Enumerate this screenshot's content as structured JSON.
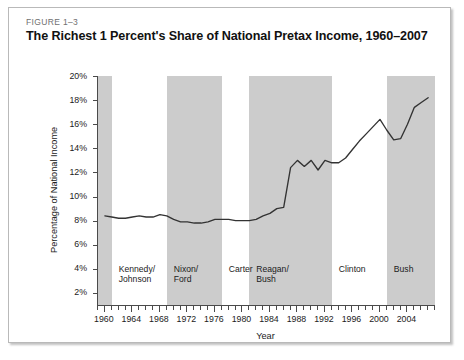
{
  "figure": {
    "number": "FIGURE 1–3",
    "title": "The Richest 1 Percent's Share of National Pretax Income, 1960–2007"
  },
  "chart_data": {
    "type": "line",
    "title": "The Richest 1 Percent's Share of National Pretax Income, 1960–2007",
    "xlabel": "Year",
    "ylabel": "Percentage of National Income",
    "xlim": [
      1959,
      2008
    ],
    "ylim": [
      1,
      20
    ],
    "grid": false,
    "legend": "none",
    "line_color": "#333333",
    "band_color": "#cccccc",
    "y_ticks": [
      "2%",
      "4%",
      "6%",
      "8%",
      "10%",
      "12%",
      "14%",
      "16%",
      "18%",
      "20%"
    ],
    "y_tick_values": [
      2,
      4,
      6,
      8,
      10,
      12,
      14,
      16,
      18,
      20
    ],
    "x_ticks": [
      "1960",
      "1964",
      "1968",
      "1972",
      "1976",
      "1980",
      "1984",
      "1988",
      "1992",
      "1996",
      "2000",
      "2004"
    ],
    "x_tick_values": [
      1960,
      1964,
      1968,
      1972,
      1976,
      1980,
      1984,
      1988,
      1992,
      1996,
      2000,
      2004
    ],
    "x_minor_tick_step": 1,
    "x": [
      1960,
      1961,
      1962,
      1963,
      1964,
      1965,
      1966,
      1967,
      1968,
      1969,
      1970,
      1971,
      1972,
      1973,
      1974,
      1975,
      1976,
      1977,
      1978,
      1979,
      1980,
      1981,
      1982,
      1983,
      1984,
      1985,
      1986,
      1987,
      1988,
      1989,
      1990,
      1991,
      1992,
      1993,
      1994,
      1995,
      1996,
      1997,
      1998,
      1999,
      2000,
      2001,
      2002,
      2003,
      2004,
      2005,
      2006,
      2007
    ],
    "values": [
      8.4,
      8.3,
      8.2,
      8.2,
      8.3,
      8.4,
      8.3,
      8.3,
      8.5,
      8.4,
      8.1,
      7.9,
      7.9,
      7.8,
      7.8,
      7.9,
      8.1,
      8.1,
      8.1,
      8.0,
      8.0,
      8.0,
      8.1,
      8.4,
      8.6,
      9.0,
      9.1,
      12.4,
      13.0,
      12.5,
      13.0,
      12.2,
      13.0,
      12.8,
      12.8,
      13.2,
      13.9,
      14.6,
      15.2,
      15.8,
      16.4,
      15.5,
      14.7,
      14.8,
      16.0,
      17.4,
      17.8,
      18.2
    ],
    "annotations": [
      {
        "label": "Kennedy/\nJohnson",
        "start": 1961,
        "end": 1969,
        "shaded": false
      },
      {
        "label": "Nixon/\nFord",
        "start": 1969,
        "end": 1977,
        "shaded": true
      },
      {
        "label": "Carter",
        "start": 1977,
        "end": 1981,
        "shaded": false
      },
      {
        "label": "Reagan/\nBush",
        "start": 1981,
        "end": 1993,
        "shaded": true
      },
      {
        "label": "Clinton",
        "start": 1993,
        "end": 2001,
        "shaded": false
      },
      {
        "label": "Bush",
        "start": 2001,
        "end": 2008,
        "shaded": true
      }
    ]
  },
  "eras": [
    {
      "name": "pre-kennedy",
      "label": "",
      "start": 1959,
      "end": 1961,
      "shaded": true
    },
    {
      "name": "kennedy-johnson",
      "label_line1": "Kennedy/",
      "label_line2": "Johnson",
      "start": 1961,
      "end": 1969,
      "shaded": false
    },
    {
      "name": "nixon-ford",
      "label_line1": "Nixon/",
      "label_line2": "Ford",
      "start": 1969,
      "end": 1977,
      "shaded": true
    },
    {
      "name": "carter",
      "label_line1": "Carter",
      "label_line2": "",
      "start": 1977,
      "end": 1981,
      "shaded": false
    },
    {
      "name": "reagan-bush",
      "label_line1": "Reagan/",
      "label_line2": "Bush",
      "start": 1981,
      "end": 1993,
      "shaded": true
    },
    {
      "name": "clinton",
      "label_line1": "Clinton",
      "label_line2": "",
      "start": 1993,
      "end": 2001,
      "shaded": false
    },
    {
      "name": "bush",
      "label_line1": "Bush",
      "label_line2": "",
      "start": 2001,
      "end": 2008,
      "shaded": true
    }
  ]
}
